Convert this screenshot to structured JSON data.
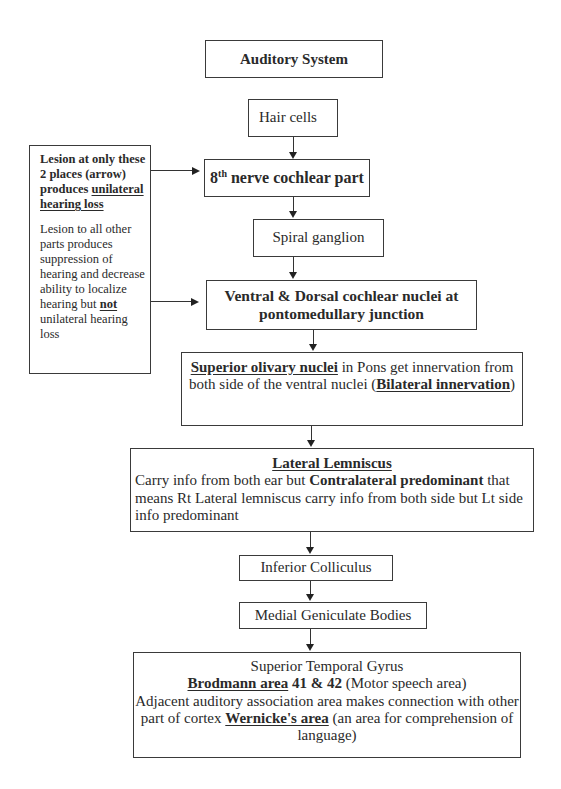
{
  "diagram": {
    "title": "Auditory System",
    "nodes": {
      "hair_cells": "Hair cells",
      "nerve8": {
        "number": "8",
        "sup": "th",
        "rest": " nerve cochlear part"
      },
      "spiral_ganglion": "Spiral ganglion",
      "ventral_dorsal": {
        "line1": "Ventral & Dorsal cochlear nuclei at",
        "line2": "pontomedullary junction"
      },
      "superior_olivary": {
        "bold_u": "Superior olivary nuclei",
        "text1": " in Pons get innervation from both side of the ventral nuclei (",
        "bold_u2": "Bilateral innervation",
        "text2": ")"
      },
      "lateral_lemniscus": {
        "heading": "Lateral Lemniscus",
        "text1": "Carry info from both ear but ",
        "bold": "Contralateral predominant",
        "text2": " that means Rt Lateral lemniscus carry info from both side but Lt side info predominant"
      },
      "inferior_colliculus": "Inferior Colliculus",
      "medial_geniculate": "Medial Geniculate Bodies",
      "superior_temporal": {
        "line1": "Superior Temporal Gyrus",
        "bold_u": "Brodmann area",
        "bold": " 41 & 42",
        "text1": " (Motor speech area)",
        "text2": "Adjacent auditory association area makes connection with other part of cortex ",
        "bold_u2": "Wernicke's area",
        "text3": " (an area for comprehension of language)"
      }
    },
    "note": {
      "p1_bold": "Lesion at only these 2 places (arrow) produces ",
      "p1_bold_u": "unilateral hearing loss",
      "p2_text1": "Lesion to all other parts produces suppression of hearing and decrease ability to localize hearing but ",
      "p2_bold_u": "not",
      "p2_text2": " unilateral hearing loss"
    }
  }
}
